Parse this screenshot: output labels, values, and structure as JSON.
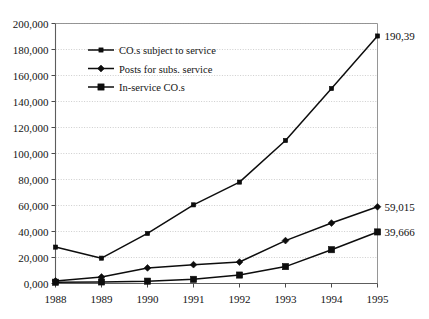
{
  "chart_data": {
    "type": "line",
    "title": "",
    "subtitle": "",
    "xlabel": "",
    "ylabel": "",
    "grid": true,
    "legend_position": "inside-top-left",
    "categories": [
      "1988",
      "1989",
      "1990",
      "1991",
      "1992",
      "1993",
      "1994",
      "1995"
    ],
    "x": [
      1988,
      1989,
      1990,
      1991,
      1992,
      1993,
      1994,
      1995
    ],
    "xlim": [
      1988,
      1995
    ],
    "ylim": [
      0,
      200000
    ],
    "ytick_step": 20000,
    "ytick_labels": [
      "0,000",
      "20,000",
      "40,000",
      "60,000",
      "80,000",
      "100,000",
      "120,000",
      "140,000",
      "160,000",
      "180,000",
      "200,000"
    ],
    "ytick_values": [
      0,
      20000,
      40000,
      60000,
      80000,
      100000,
      120000,
      140000,
      160000,
      180000,
      200000
    ],
    "series": [
      {
        "name": "CO.s subject to service",
        "marker": "line",
        "values": [
          28000,
          19500,
          38500,
          60500,
          78000,
          110000,
          150000,
          190390
        ],
        "end_label": "190,39"
      },
      {
        "name": "Posts for subs. service",
        "marker": "diamond",
        "values": [
          2000,
          5000,
          12000,
          14500,
          16500,
          33000,
          46500,
          59015
        ],
        "end_label": "59,015"
      },
      {
        "name": "In-service CO.s",
        "marker": "square",
        "values": [
          1000,
          1200,
          1800,
          3200,
          6500,
          13000,
          26000,
          39666
        ],
        "end_label": "39,666"
      }
    ],
    "end_labels": [
      "190,39",
      "59,015",
      "39,666"
    ],
    "colors": {
      "series_stroke": "#0d0d0d",
      "gridline": "#b9b9b9",
      "axis": "#5d5d5d",
      "text": "#141414",
      "background": "#ffffff"
    }
  },
  "legend": {
    "items": [
      {
        "label": "CO.s subject to service",
        "marker": "line"
      },
      {
        "label": "Posts for subs. service",
        "marker": "diamond"
      },
      {
        "label": "In-service CO.s",
        "marker": "square"
      }
    ]
  }
}
